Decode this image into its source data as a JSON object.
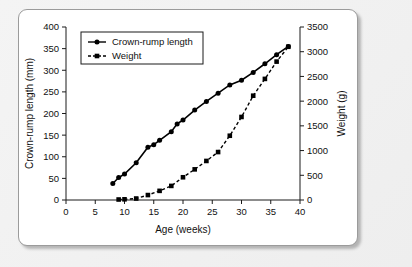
{
  "figure": {
    "caption": "",
    "background_color": "#f0f0f0",
    "card_color": "#ffffff",
    "border_color": "#9b9b9b"
  },
  "chart_data": {
    "type": "line",
    "title": "",
    "xlabel": "Age (weeks)",
    "ylabel": "Crown-rump length (mm)",
    "y2label": "Weight (g)",
    "xlim": [
      0,
      40
    ],
    "ylim": [
      0,
      400
    ],
    "y2lim": [
      0,
      3500
    ],
    "xticks": [
      0,
      5,
      10,
      15,
      20,
      25,
      30,
      35,
      40
    ],
    "xticklabels": [
      "0",
      "5",
      "10",
      "15",
      "20",
      "25",
      "30",
      "35",
      "40"
    ],
    "yticks": [
      0,
      50,
      100,
      150,
      200,
      250,
      300,
      350,
      400
    ],
    "yticklabels": [
      "0",
      "50",
      "100",
      "150",
      "200",
      "250",
      "300",
      "350",
      "400"
    ],
    "y2ticks": [
      0,
      500,
      1000,
      1500,
      2000,
      2500,
      3000,
      3500
    ],
    "y2ticklabels": [
      "0",
      "500",
      "1000",
      "1500",
      "2000",
      "2500",
      "3000",
      "3500"
    ],
    "grid": false,
    "legend_position": "upper left",
    "series": [
      {
        "name": "Crown-rump length",
        "axis": "left",
        "units": "mm",
        "linestyle": "solid",
        "marker": "circle",
        "color": "#000000",
        "x": [
          8,
          9,
          10,
          12,
          14,
          15,
          16,
          18,
          19,
          20,
          22,
          24,
          26,
          28,
          30,
          32,
          34,
          36,
          38
        ],
        "values": [
          38,
          52,
          60,
          86,
          122,
          128,
          138,
          158,
          176,
          185,
          208,
          228,
          247,
          266,
          277,
          295,
          315,
          336,
          355
        ]
      },
      {
        "name": "Weight",
        "axis": "right",
        "units": "g",
        "linestyle": "dashed",
        "marker": "square",
        "color": "#000000",
        "x": [
          9,
          10,
          12,
          14,
          16,
          18,
          20,
          22,
          24,
          26,
          28,
          30,
          32,
          34,
          36,
          38
        ],
        "values": [
          10,
          14,
          30,
          100,
          185,
          285,
          460,
          620,
          790,
          970,
          1300,
          1680,
          2110,
          2450,
          2800,
          3100
        ]
      }
    ],
    "legend": [
      {
        "label": "Crown-rump length",
        "marker": "circle",
        "linestyle": "solid"
      },
      {
        "label": "Weight",
        "marker": "square",
        "linestyle": "dashed"
      }
    ]
  }
}
